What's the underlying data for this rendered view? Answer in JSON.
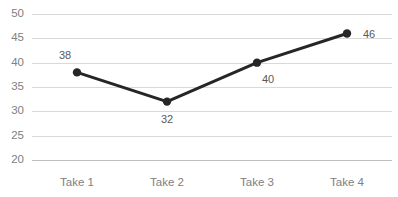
{
  "chart_data": {
    "type": "line",
    "title": "",
    "subtitle": "",
    "xlabel": "",
    "ylabel": "",
    "categories": [
      "Take 1",
      "Take 2",
      "Take 3",
      "Take 4"
    ],
    "values": [
      38,
      32,
      40,
      46
    ],
    "data_labels": [
      "38",
      "32",
      "40",
      "46"
    ],
    "series": [
      {
        "name": "",
        "values": [
          38,
          32,
          40,
          46
        ]
      }
    ],
    "ylim": [
      20,
      50
    ],
    "yticks": [
      50,
      45,
      40,
      35,
      30,
      25,
      20
    ],
    "ytick_labels": [
      "50",
      "45",
      "40",
      "35",
      "30",
      "25",
      "20"
    ],
    "grid": true,
    "legend": false,
    "legend_position": "none",
    "colors": {
      "line": "#262626",
      "marker": "#262626",
      "gridline": "#d9d9d9",
      "axisline": "#bfbfbf",
      "tick_text": "#808080",
      "datalabel_text": "#595959",
      "background": "#ffffff"
    },
    "label_offsets": [
      {
        "dx": -12,
        "dy": -16,
        "anchor": "middle"
      },
      {
        "dx": 0,
        "dy": 18,
        "anchor": "middle"
      },
      {
        "dx": 11,
        "dy": 17,
        "anchor": "middle"
      },
      {
        "dx": 22,
        "dy": 2,
        "anchor": "middle"
      }
    ]
  }
}
